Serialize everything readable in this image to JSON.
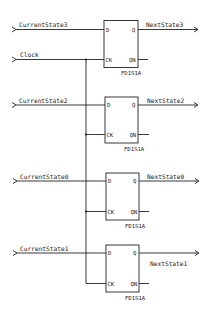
{
  "diagram": {
    "type": "schematic",
    "clock": {
      "label": "Clock"
    },
    "flipflops": [
      {
        "cell": "FD1S1A",
        "input": "CurrentState3",
        "output": "NextState3",
        "pins": {
          "d": "D",
          "q": "Q",
          "ck": "CK",
          "qn": "QN"
        }
      },
      {
        "cell": "FD1S1A",
        "input": "CurrentState2",
        "output": "NextState2",
        "pins": {
          "d": "D",
          "q": "Q",
          "ck": "CK",
          "qn": "QN"
        }
      },
      {
        "cell": "FD1S1A",
        "input": "CurrentState0",
        "output": "NextState0",
        "pins": {
          "d": "D",
          "q": "Q",
          "ck": "CK",
          "qn": "QN"
        }
      },
      {
        "cell": "FD1S1A",
        "input": "CurrentState1",
        "output": "NextState1",
        "pins": {
          "d": "D",
          "q": "Q",
          "ck": "CK",
          "qn": "QN"
        }
      }
    ]
  }
}
